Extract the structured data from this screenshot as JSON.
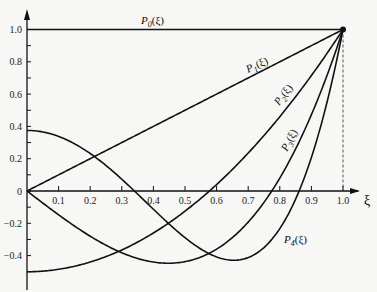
{
  "chart_data": {
    "type": "line",
    "title": "",
    "xlabel": "ξ",
    "ylabel": "",
    "xlim": [
      0,
      1.0
    ],
    "ylim": [
      -0.5,
      1.0
    ],
    "grid": false,
    "x_ticks": [
      "0.1",
      "0.2",
      "0.3",
      "0.4",
      "0.5",
      "0.6",
      "0.7",
      "0.8",
      "0.9",
      "1.0"
    ],
    "y_ticks": [
      "1.0",
      "0.8",
      "0.6",
      "0.4",
      "0.2",
      "0",
      "-0.2",
      "-0.4"
    ],
    "series": [
      {
        "name": "P0(ξ)",
        "formula": "1",
        "points": [
          [
            0,
            1
          ],
          [
            1,
            1
          ]
        ]
      },
      {
        "name": "P1(ξ)",
        "formula": "ξ",
        "points": [
          [
            0,
            0
          ],
          [
            1,
            1
          ]
        ]
      },
      {
        "name": "P2(ξ)",
        "formula": "(3ξ²-1)/2",
        "points": [
          [
            0,
            -0.5
          ],
          [
            0.2,
            -0.44
          ],
          [
            0.4,
            -0.26
          ],
          [
            0.577,
            0
          ],
          [
            0.8,
            0.46
          ],
          [
            1,
            1
          ]
        ]
      },
      {
        "name": "P3(ξ)",
        "formula": "(5ξ³-3ξ)/2",
        "points": [
          [
            0,
            0
          ],
          [
            0.2,
            -0.28
          ],
          [
            0.447,
            -0.447
          ],
          [
            0.6,
            -0.36
          ],
          [
            0.775,
            0
          ],
          [
            1,
            1
          ]
        ]
      },
      {
        "name": "P4(ξ)",
        "formula": "(35ξ⁴-30ξ²+3)/8",
        "points": [
          [
            0,
            0.375
          ],
          [
            0.2,
            0.232
          ],
          [
            0.34,
            0
          ],
          [
            0.5,
            -0.289
          ],
          [
            0.655,
            -0.429
          ],
          [
            0.8,
            -0.233
          ],
          [
            0.861,
            0
          ],
          [
            1,
            1
          ]
        ]
      }
    ],
    "annotations": [
      "dashed vertical line at ξ=1.0"
    ]
  },
  "labels": {
    "p0": "P",
    "p0_sub": "0",
    "p0_arg": "(ξ)",
    "p1": "P",
    "p1_sub": "1",
    "p1_arg": "(ξ)",
    "p2": "P",
    "p2_sub": "2",
    "p2_arg": "(ξ)",
    "p3": "P",
    "p3_sub": "3",
    "p3_arg": "(ξ)",
    "p4": "P",
    "p4_sub": "4",
    "p4_arg": "(ξ)",
    "x_axis": "ξ"
  }
}
